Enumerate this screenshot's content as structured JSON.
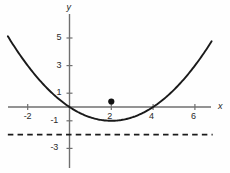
{
  "chart_data": {
    "type": "line",
    "title": "",
    "xlabel": "x",
    "ylabel": "y",
    "xlim": [
      -3.1,
      7.4
    ],
    "ylim": [
      -3.9,
      6.0
    ],
    "grid": false,
    "legend": null,
    "axis_labels": {
      "x": "x",
      "y": "y"
    },
    "xticks": [
      {
        "value": -2,
        "label": "-2"
      },
      {
        "value": 2,
        "label": "2"
      },
      {
        "value": 4,
        "label": "4"
      },
      {
        "value": 6,
        "label": "6"
      }
    ],
    "yticks": [
      {
        "value": 5,
        "label": "5"
      },
      {
        "value": 3,
        "label": "3"
      },
      {
        "value": 1,
        "label": "1"
      },
      {
        "value": -1,
        "label": "-1"
      },
      {
        "value": -3,
        "label": "-3"
      }
    ],
    "series": [
      {
        "name": "parabola",
        "type": "curve",
        "equation": "y = 0.25*(x - 2)^2 - 1",
        "vertex": [
          2,
          -1
        ],
        "roots": [
          0,
          4
        ],
        "color": "#1a1a1a",
        "linestyle": "solid",
        "linewidth": 1.9,
        "x_start": -2.95,
        "x_end": 6.8
      },
      {
        "name": "asymptote-line",
        "type": "horizontal-line",
        "y": -2,
        "color": "#1a1a1a",
        "linestyle": "dashed",
        "linewidth": 1.8,
        "x_start": -2.95,
        "x_end": 6.85
      }
    ],
    "points": [
      {
        "name": "marked-point",
        "x": 2,
        "y": 0.4,
        "label": "2",
        "color": "#111111",
        "radius": 3.1
      }
    ],
    "axes": {
      "x_axis_color": "#6f6f6f",
      "y_axis_color": "#6f6f6f",
      "x_axis_y": 0,
      "y_axis_x": 0
    }
  },
  "geometry": {
    "origin_px": {
      "x": 69.5,
      "y": 107
    },
    "unit_px": {
      "x": 20.9,
      "y": 13.8
    }
  }
}
